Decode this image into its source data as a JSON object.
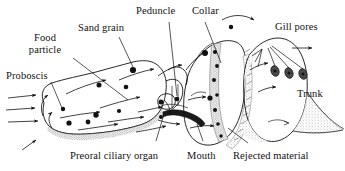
{
  "figure": {
    "background_color": "#ffffff",
    "ink_color": "#111111",
    "stipple_color": "#8a8a8a",
    "pore_fill": "#4a4a4a"
  },
  "labels": {
    "food_particle": "Food\nparticle",
    "food_particle_line1": "Food",
    "food_particle_line2": "particle",
    "sand_grain": "Sand grain",
    "peduncle": "Peduncle",
    "collar": "Collar",
    "gill_pores": "Gill pores",
    "proboscis": "Proboscis",
    "trunk": "Trunk",
    "preoral_ciliary_organ": "Preoral ciliary organ",
    "mouth": "Mouth",
    "rejected_material": "Rejected material"
  },
  "anatomy_parts": [
    {
      "name": "Proboscis",
      "region": "anterior"
    },
    {
      "name": "Collar",
      "region": "middle"
    },
    {
      "name": "Trunk",
      "region": "posterior"
    },
    {
      "name": "Peduncle",
      "region": "middle"
    },
    {
      "name": "Mouth",
      "region": "ventral-middle"
    },
    {
      "name": "Preoral ciliary organ",
      "region": "ventral-anterior"
    },
    {
      "name": "Gill pores",
      "region": "dorsal-posterior"
    }
  ],
  "annotated_items": [
    {
      "name": "Food particle",
      "kind": "particle"
    },
    {
      "name": "Sand grain",
      "kind": "particle"
    },
    {
      "name": "Rejected material",
      "kind": "stream"
    }
  ],
  "counts": {
    "gill_pores": 3,
    "inflow_arrows": 4,
    "particle_dots": 14
  }
}
